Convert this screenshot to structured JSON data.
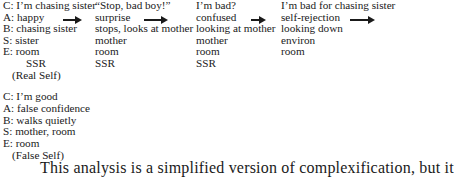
{
  "real_self_sequence": {
    "steps": [
      {
        "lines": [
          "C: I’m chasing sister",
          "A: happy",
          "B: chasing sister",
          "S: sister",
          "E: room",
          "SSR",
          "(Real Self)"
        ]
      },
      {
        "lines": [
          "“Stop, bad boy!”",
          "surprise",
          "stops, looks at mother",
          "mother",
          "room",
          "SSR"
        ]
      },
      {
        "lines": [
          "I’m bad?",
          "confused",
          "looking at mother",
          "mother",
          "room",
          "SSR"
        ]
      },
      {
        "lines": [
          "I’m bad for chasing sister",
          "self-rejection",
          "looking down",
          "environ",
          "room"
        ]
      }
    ]
  },
  "false_self": {
    "lines": [
      "C: I’m good",
      "A: false confidence",
      "B: walks quietly",
      "S: mother, room",
      "E: room",
      "(False Self)"
    ]
  },
  "paragraph": {
    "text": "This analysis is a simplified version of complexification, but it"
  }
}
